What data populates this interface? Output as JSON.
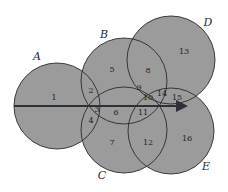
{
  "diagram": {
    "type": "overlapping-circles",
    "colors": {
      "background": "#ffffff",
      "circle_fill": "#9b9b9b",
      "circle_stroke": "#2a2a2a",
      "line": "#2f2f3a",
      "text": "#1e1e1e"
    },
    "circles": [
      {
        "name": "A",
        "cx": 57,
        "cy": 106,
        "r": 43,
        "label_x": 37,
        "label_y": 57
      },
      {
        "name": "B",
        "cx": 124,
        "cy": 81,
        "r": 43,
        "label_x": 104,
        "label_y": 35
      },
      {
        "name": "C",
        "cx": 124,
        "cy": 130,
        "r": 43,
        "label_x": 102,
        "label_y": 176
      },
      {
        "name": "D",
        "cx": 171,
        "cy": 60,
        "r": 44,
        "label_x": 208,
        "label_y": 23
      },
      {
        "name": "E",
        "cx": 171,
        "cy": 131,
        "r": 43,
        "label_x": 206,
        "label_y": 167
      }
    ],
    "set_labels": {
      "A": "A",
      "B": "B",
      "C": "C",
      "D": "D",
      "E": "E"
    },
    "regions": [
      {
        "label": "1",
        "x": 54,
        "y": 98
      },
      {
        "label": "2",
        "x": 91,
        "y": 91
      },
      {
        "label": "3",
        "x": 97,
        "y": 110
      },
      {
        "label": "4",
        "x": 91,
        "y": 121
      },
      {
        "label": "5",
        "x": 112,
        "y": 70
      },
      {
        "label": "6",
        "x": 116,
        "y": 113
      },
      {
        "label": "7",
        "x": 112,
        "y": 143
      },
      {
        "label": "8",
        "x": 148,
        "y": 71
      },
      {
        "label": "9",
        "x": 139,
        "y": 88
      },
      {
        "label": "10",
        "x": 148,
        "y": 98
      },
      {
        "label": "11",
        "x": 143,
        "y": 113
      },
      {
        "label": "12",
        "x": 148,
        "y": 143
      },
      {
        "label": "13",
        "x": 184,
        "y": 52
      },
      {
        "label": "14",
        "x": 162,
        "y": 94
      },
      {
        "label": "15",
        "x": 177,
        "y": 98
      },
      {
        "label": "16",
        "x": 187,
        "y": 139
      }
    ],
    "arrow_line": {
      "x1": 14,
      "y1": 106,
      "x2": 190,
      "y2": 106
    }
  }
}
